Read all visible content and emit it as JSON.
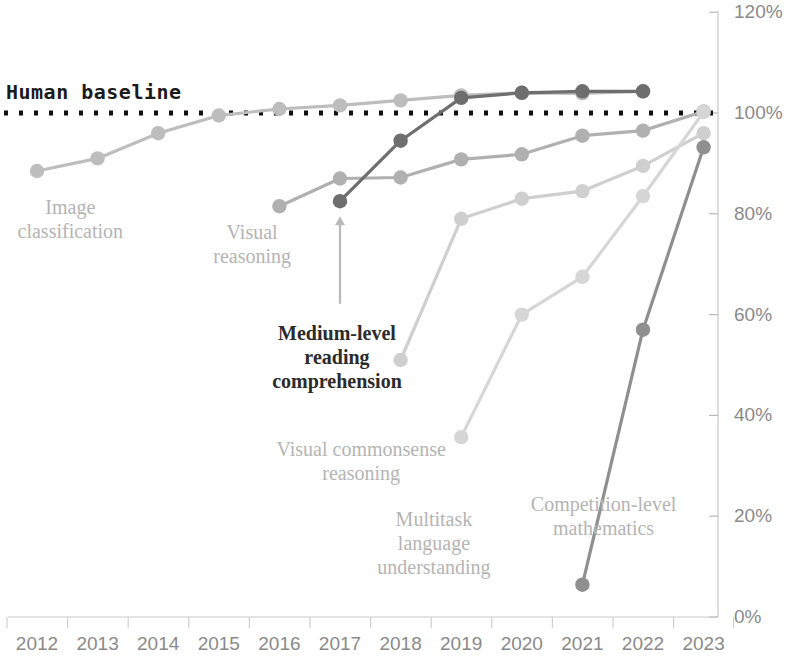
{
  "chart_data": {
    "type": "line",
    "title": "",
    "subtitle": "",
    "xlabel": "",
    "ylabel": "",
    "x": [
      2012,
      2013,
      2014,
      2015,
      2016,
      2017,
      2018,
      2019,
      2020,
      2021,
      2022,
      2023
    ],
    "xtick_labels": [
      "2012",
      "2013",
      "2014",
      "2015",
      "2016",
      "2017",
      "2018",
      "2019",
      "2020",
      "2021",
      "2022",
      "2023"
    ],
    "ytick_labels": [
      "0%",
      "20%",
      "40%",
      "60%",
      "80%",
      "100%",
      "120%"
    ],
    "ytick_values": [
      0,
      20,
      40,
      60,
      80,
      100,
      120
    ],
    "ylim": [
      0,
      120
    ],
    "xlim": [
      2011.5,
      2023.5
    ],
    "grid": false,
    "legend": "inline-annotations",
    "baseline": {
      "label": "Human baseline",
      "value": 100,
      "style": "dotted",
      "color": "#111111"
    },
    "series": [
      {
        "name": "Image classification",
        "color": "#bdbdbd",
        "label_x": 2012.55,
        "label_y": 80,
        "label_lines": [
          "Image",
          "classification"
        ],
        "points": [
          {
            "x": 2012,
            "y": 88.5
          },
          {
            "x": 2013,
            "y": 91.0
          },
          {
            "x": 2014,
            "y": 96.0
          },
          {
            "x": 2015,
            "y": 99.5
          },
          {
            "x": 2016,
            "y": 100.8
          },
          {
            "x": 2017,
            "y": 101.5
          },
          {
            "x": 2018,
            "y": 102.5
          },
          {
            "x": 2019,
            "y": 103.5
          },
          {
            "x": 2020,
            "y": 104.0
          },
          {
            "x": 2021,
            "y": 103.9
          },
          {
            "x": 2022,
            "y": 104.3
          }
        ]
      },
      {
        "name": "Visual reasoning",
        "color": "#b0b0b0",
        "label_x": 2015.55,
        "label_y": 75,
        "label_lines": [
          "Visual",
          "reasoning"
        ],
        "points": [
          {
            "x": 2016,
            "y": 81.5
          },
          {
            "x": 2017,
            "y": 87.0
          },
          {
            "x": 2018,
            "y": 87.2
          },
          {
            "x": 2019,
            "y": 90.8
          },
          {
            "x": 2020,
            "y": 91.8
          },
          {
            "x": 2021,
            "y": 95.5
          },
          {
            "x": 2022,
            "y": 96.5
          },
          {
            "x": 2023,
            "y": 100.3
          }
        ]
      },
      {
        "name": "Medium-level reading comprehension",
        "color": "#6e6e6e",
        "label_x": 2016.95,
        "label_y": 55,
        "label_lines": [
          "Medium-level",
          "reading",
          "comprehension"
        ],
        "annotation_arrow": true,
        "points": [
          {
            "x": 2017,
            "y": 82.5
          },
          {
            "x": 2018,
            "y": 94.5
          },
          {
            "x": 2019,
            "y": 103.0
          },
          {
            "x": 2020,
            "y": 104.0
          },
          {
            "x": 2021,
            "y": 104.3
          },
          {
            "x": 2022,
            "y": 104.3
          }
        ]
      },
      {
        "name": "Visual commonsense reasoning",
        "color": "#cfcfcf",
        "label_x": 2017.35,
        "label_y": 32,
        "label_lines": [
          "Visual commonsense",
          "reasoning"
        ],
        "points": [
          {
            "x": 2018,
            "y": 51.0
          },
          {
            "x": 2019,
            "y": 79.0
          },
          {
            "x": 2020,
            "y": 83.0
          },
          {
            "x": 2021,
            "y": 84.5
          },
          {
            "x": 2022,
            "y": 89.5
          },
          {
            "x": 2023,
            "y": 96.0
          }
        ]
      },
      {
        "name": "Multitask language understanding",
        "color": "#d6d6d6",
        "label_x": 2018.55,
        "label_y": 18,
        "label_lines": [
          "Multitask",
          "language",
          "understanding"
        ],
        "points": [
          {
            "x": 2019,
            "y": 35.7
          },
          {
            "x": 2020,
            "y": 60.0
          },
          {
            "x": 2021,
            "y": 67.5
          },
          {
            "x": 2022,
            "y": 83.5
          },
          {
            "x": 2023,
            "y": 100.2
          }
        ]
      },
      {
        "name": "Competition-level mathematics",
        "color": "#8f8f8f",
        "label_x": 2021.35,
        "label_y": 21,
        "label_lines": [
          "Competition-level",
          "mathematics"
        ],
        "points": [
          {
            "x": 2021,
            "y": 6.4
          },
          {
            "x": 2022,
            "y": 57.0
          },
          {
            "x": 2023,
            "y": 93.2
          }
        ]
      }
    ]
  }
}
